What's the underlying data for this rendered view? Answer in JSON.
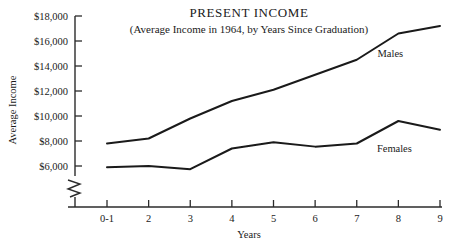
{
  "chart_data": {
    "type": "line",
    "title": "PRESENT INCOME",
    "subtitle": "(Average Income in 1964, by Years Since Graduation)",
    "xlabel": "Years",
    "ylabel": "Average Income",
    "categories": [
      "0-1",
      "2",
      "3",
      "4",
      "5",
      "6",
      "7",
      "8",
      "9"
    ],
    "ytick_labels": [
      "$18,000",
      "$16,000",
      "$14,000",
      "$12,000",
      "$10,000",
      "$8,000",
      "$6,000"
    ],
    "ytick_values": [
      18000,
      16000,
      14000,
      12000,
      10000,
      8000,
      6000
    ],
    "ylim": [
      6000,
      18000
    ],
    "y_axis_break": true,
    "grid": false,
    "legend": "inline-labels",
    "series": [
      {
        "name": "Males",
        "label": "Males",
        "color": "#1a1a1a",
        "values": [
          7800,
          8200,
          9800,
          11200,
          12100,
          13300,
          14500,
          16600,
          17200
        ]
      },
      {
        "name": "Females",
        "label": "Females",
        "color": "#1a1a1a",
        "values": [
          5900,
          6000,
          5750,
          7400,
          7900,
          7550,
          7800,
          9600,
          8900
        ]
      }
    ]
  }
}
